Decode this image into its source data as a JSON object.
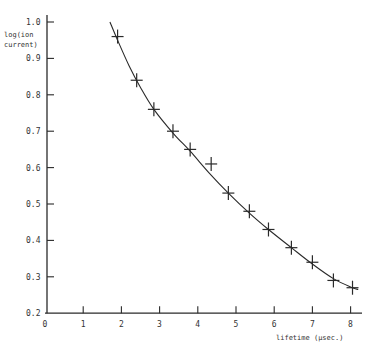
{
  "chart_data": {
    "type": "scatter",
    "title": "",
    "xlabel": "lifetime (μsec.)",
    "ylabel_lines": [
      "log(ion",
      "current)"
    ],
    "ylabel": "log(ion current)",
    "xlim": [
      0,
      8.5
    ],
    "ylim": [
      0.2,
      1.0
    ],
    "grid": false,
    "legend": null,
    "x_ticks": [
      0,
      1,
      2,
      3,
      4,
      5,
      6,
      7,
      8
    ],
    "x_tick_labels": [
      "0",
      "1",
      "2",
      "3",
      "4",
      "5",
      "6",
      "7",
      "8"
    ],
    "y_ticks": [
      0.2,
      0.3,
      0.4,
      0.5,
      0.6,
      0.7,
      0.8,
      0.9,
      1.0
    ],
    "y_tick_labels": [
      "0.2",
      "0.3",
      "0.4",
      "0.5",
      "0.6",
      "0.7",
      "0.8",
      "0.9",
      "1.0"
    ],
    "series": [
      {
        "name": "measured",
        "marker": "+",
        "x": [
          1.9,
          2.4,
          2.85,
          3.35,
          3.8,
          4.35,
          4.8,
          5.35,
          5.85,
          6.45,
          7.0,
          7.55,
          8.05
        ],
        "y": [
          0.96,
          0.84,
          0.76,
          0.7,
          0.65,
          0.61,
          0.53,
          0.48,
          0.43,
          0.38,
          0.34,
          0.29,
          0.27
        ]
      },
      {
        "name": "fitted curve",
        "marker": "line",
        "x": [
          1.7,
          1.9,
          2.2,
          2.5,
          2.85,
          3.35,
          3.8,
          4.3,
          4.8,
          5.35,
          5.85,
          6.45,
          7.0,
          7.55,
          8.05,
          8.2
        ],
        "y": [
          1.0,
          0.95,
          0.88,
          0.82,
          0.76,
          0.695,
          0.645,
          0.585,
          0.53,
          0.475,
          0.43,
          0.38,
          0.335,
          0.295,
          0.27,
          0.265
        ]
      }
    ]
  }
}
